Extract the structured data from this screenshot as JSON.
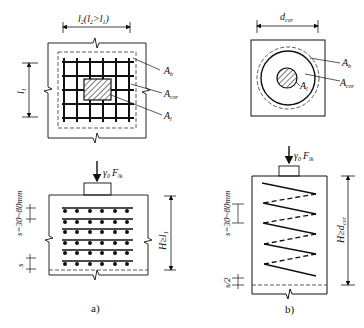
{
  "panel_a": {
    "caption": "a)",
    "plan": {
      "width_dim": "l₂(l₂>l₁)",
      "height_dim": "l₁",
      "labels": {
        "Ab": "Aᵦ",
        "Acor": "A꜀ₒᵣ",
        "Al": "Aₗ"
      },
      "Ab": "A",
      "Ab_sub": "b",
      "Acor": "A",
      "Acor_sub": "cor",
      "Al": "A",
      "Al_sub": "l"
    },
    "elevation": {
      "load": "γ",
      "load_sub": "0",
      "load_F": "F",
      "load_F_sub": "lk",
      "spacing": "s=30~80mm",
      "spacing_small": "s",
      "height_dim": "H≥l₁"
    }
  },
  "panel_b": {
    "caption": "b)",
    "plan": {
      "width_dim": "d",
      "width_dim_sub": "cor",
      "Ab": "A",
      "Ab_sub": "b",
      "Acor": "A",
      "Acor_sub": "cor",
      "Al": "A",
      "Al_sub": "l"
    },
    "elevation": {
      "load": "γ",
      "load_sub": "0",
      "load_F": "F",
      "load_F_sub": "lk",
      "spacing": "s=30~80mm",
      "spacing_half": "s/2",
      "height_dim": "H≥d",
      "height_dim_sub": "cor"
    }
  }
}
